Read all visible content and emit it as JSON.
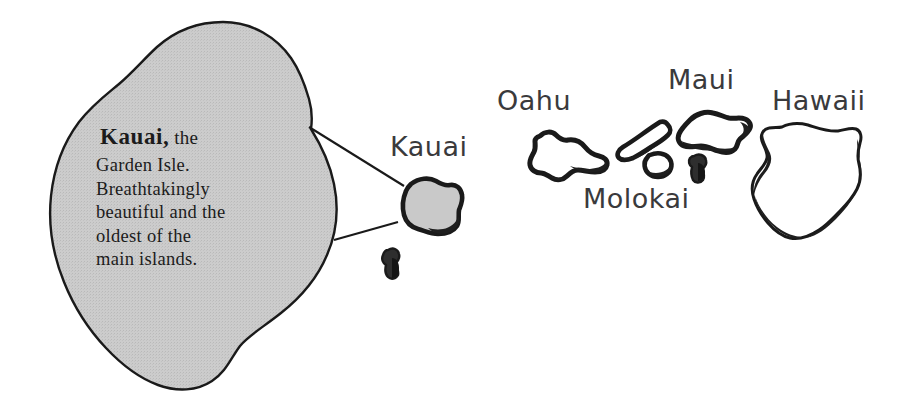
{
  "figure": {
    "name": "hawaiian-islands-illustration",
    "background_color": "#ffffff"
  },
  "callout": {
    "headline_strong": "Kauai,",
    "headline_rest": " the",
    "body_lines": [
      "Garden Isle.",
      "Breathtakingly",
      "beautiful and the",
      "oldest of the",
      "main islands."
    ],
    "fill_color": "#c9c9c9",
    "outline_color": "#111111"
  },
  "labels": {
    "kauai": "Kauai",
    "oahu": "Oahu",
    "molokai": "Molokai",
    "maui": "Maui",
    "hawaii": "Hawaii",
    "color": "#3a3a3c"
  },
  "islands": [
    {
      "name": "kauai",
      "label": "Kauai",
      "fill": "#c9c9c9",
      "stroke": "#1a1a1a"
    },
    {
      "name": "niihau",
      "label": "",
      "fill": "#2b2b2b",
      "stroke": "#1a1a1a"
    },
    {
      "name": "oahu",
      "label": "Oahu",
      "fill": "#ffffff",
      "stroke": "#1a1a1a"
    },
    {
      "name": "molokai",
      "label": "Molokai",
      "fill": "#ffffff",
      "stroke": "#1a1a1a"
    },
    {
      "name": "lanai",
      "label": "",
      "fill": "#ffffff",
      "stroke": "#1a1a1a"
    },
    {
      "name": "maui",
      "label": "Maui",
      "fill": "#ffffff",
      "stroke": "#1a1a1a"
    },
    {
      "name": "kahoolawe",
      "label": "",
      "fill": "#ffffff",
      "stroke": "#1a1a1a"
    },
    {
      "name": "hawaii",
      "label": "Hawaii",
      "fill": "#ffffff",
      "stroke": "#1a1a1a"
    }
  ]
}
